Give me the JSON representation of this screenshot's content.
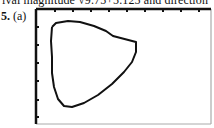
{
  "header": {
    "cropped_text": "ival magnitude √9.75+5.125 and direction"
  },
  "problem": {
    "number": "5.",
    "part": "(a)"
  },
  "graph": {
    "frame": {
      "left": 2,
      "top": 2,
      "right": 177,
      "bottom": 117
    },
    "x_ticks": [
      21,
      39,
      57,
      75,
      93,
      111,
      129,
      147,
      165
    ],
    "y_ticks": [
      20,
      38,
      56,
      74,
      93,
      110
    ],
    "curve_color": "#111111",
    "frame_color": "#111111"
  },
  "chart_data": {
    "type": "line",
    "title": "",
    "xlabel": "",
    "ylabel": "",
    "grid": false,
    "points_px": [
      [
        18,
        20
      ],
      [
        22,
        16
      ],
      [
        34,
        14
      ],
      [
        46,
        15
      ],
      [
        60,
        19
      ],
      [
        72,
        24
      ],
      [
        79,
        29
      ],
      [
        102,
        35
      ],
      [
        102,
        45
      ],
      [
        98,
        55
      ],
      [
        90,
        65
      ],
      [
        78,
        77
      ],
      [
        64,
        88
      ],
      [
        50,
        96
      ],
      [
        38,
        100
      ],
      [
        30,
        99
      ],
      [
        24,
        92
      ],
      [
        20,
        80
      ],
      [
        18,
        66
      ],
      [
        18,
        50
      ],
      [
        17,
        34
      ],
      [
        18,
        20
      ]
    ]
  }
}
